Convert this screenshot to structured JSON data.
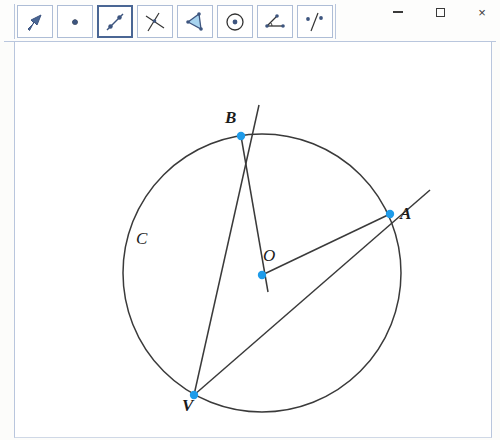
{
  "window": {
    "controls": [
      {
        "name": "minimize",
        "glyph": "minimize"
      },
      {
        "name": "maximize",
        "glyph": "maximize"
      },
      {
        "name": "close",
        "glyph": "close"
      }
    ],
    "close_glyph": "×"
  },
  "toolbar": {
    "buttons": [
      {
        "id": "move",
        "icon": "arrow-pointer-icon",
        "selected": false
      },
      {
        "id": "point",
        "icon": "point-icon",
        "selected": false
      },
      {
        "id": "line",
        "icon": "segment-icon",
        "selected": true
      },
      {
        "id": "intersect",
        "icon": "perpendicular-lines-icon",
        "selected": false
      },
      {
        "id": "polygon",
        "icon": "polygon-icon",
        "selected": false
      },
      {
        "id": "circle",
        "icon": "circle-center-icon",
        "selected": false
      },
      {
        "id": "angle",
        "icon": "angle-icon",
        "selected": false
      },
      {
        "id": "reflect",
        "icon": "reflect-line-icon",
        "selected": false
      }
    ]
  },
  "subtoolbar": {
    "buttons": [
      {
        "id": "line-through-two-points",
        "icon": "line-two-points-icon"
      },
      {
        "id": "segment-two-points",
        "icon": "segment-two-points-icon"
      },
      {
        "id": "ray-two-points",
        "icon": "ray-two-points-icon"
      }
    ]
  },
  "canvas": {
    "circle": {
      "label": "C",
      "cx": 261,
      "cy": 273,
      "r": 139,
      "stroke": "#3a3a3a"
    },
    "center": {
      "label": "O",
      "x": 261,
      "y": 275
    },
    "points": [
      {
        "label": "B",
        "x": 240,
        "y": 136
      },
      {
        "label": "A",
        "x": 389,
        "y": 214
      },
      {
        "label": "V",
        "x": 193,
        "y": 395
      },
      {
        "label": "O",
        "x": 261,
        "y": 275
      }
    ],
    "point_color": "#1e9be9",
    "line_color": "#3a3a3a",
    "segments": [
      {
        "id": "line-B-V",
        "from": "B",
        "to": "V",
        "x1": 258,
        "y1": 105,
        "x2": 193,
        "y2": 395
      },
      {
        "id": "line-B-O",
        "from": "B",
        "to": "O",
        "x1": 240,
        "y1": 136,
        "x2": 267,
        "y2": 292
      },
      {
        "id": "line-O-A",
        "from": "O",
        "to": "A",
        "x1": 261,
        "y1": 275,
        "x2": 389,
        "y2": 214
      },
      {
        "id": "line-V-A",
        "from": "V",
        "to": "A",
        "x1": 193,
        "y1": 395,
        "x2": 429,
        "y2": 190
      }
    ],
    "labels": [
      {
        "text": "B",
        "x": 224,
        "y": 118
      },
      {
        "text": "A",
        "x": 399,
        "y": 206
      },
      {
        "text": "O",
        "x": 262,
        "y": 248
      },
      {
        "text": "V",
        "x": 181,
        "y": 398
      },
      {
        "text": "C",
        "x": 135,
        "y": 231
      }
    ]
  },
  "colors": {
    "border_blue": "#b9c6dd",
    "accent_point": "#1e9be9",
    "icon_blue": "#4a6694",
    "ink": "#3a3a3a"
  }
}
